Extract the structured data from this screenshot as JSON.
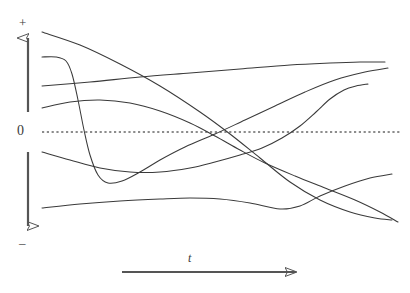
{
  "figure": {
    "kind": "line",
    "title": "",
    "background_color": "#ffffff",
    "stroke_color": "#3a3a3a",
    "axis_color": "#555555",
    "zero_line_color": "#1a1a1a",
    "width": 410,
    "height": 293
  },
  "axes": {
    "vertical": {
      "name": "amplitude-axis",
      "positive_label": "+",
      "zero_label": "0",
      "negative_label": "–",
      "zero_pixel_y": 132,
      "upper_arrow": {
        "x": 28,
        "y_tail": 112,
        "y_head": 33,
        "direction": "up"
      },
      "lower_arrow": {
        "x": 28,
        "y_tail": 152,
        "y_head": 231,
        "direction": "down"
      }
    },
    "horizontal": {
      "name": "time-axis",
      "label": "t",
      "arrow": {
        "x_tail": 122,
        "x_head": 301,
        "y": 272,
        "direction": "right"
      }
    },
    "zero_line": {
      "name": "zero-reference-line",
      "style": "dotted",
      "y": 132,
      "x_start": 42,
      "x_end": 401
    }
  },
  "chart_data": {
    "type": "line",
    "title": "",
    "xlabel": "t",
    "ylabel": "",
    "grid": false,
    "legend": null,
    "xlim": [
      42,
      401
    ],
    "ylim_pixels": [
      24,
      240
    ],
    "zero_y_pixel": 132,
    "note": "Six unlabeled qualitative curves drawn over a dotted zero reference line; values are pixel coordinates of the traced paths.",
    "series": [
      {
        "name": "curve-1-descending-steep",
        "points": [
          [
            42,
            32
          ],
          [
            80,
            45
          ],
          [
            120,
            64
          ],
          [
            160,
            86
          ],
          [
            200,
            112
          ],
          [
            230,
            134
          ],
          [
            260,
            158
          ],
          [
            290,
            182
          ],
          [
            320,
            200
          ],
          [
            350,
            212
          ],
          [
            375,
            218
          ],
          [
            392,
            220
          ]
        ]
      },
      {
        "name": "curve-2-early-plunge-recover",
        "points": [
          [
            42,
            57
          ],
          [
            56,
            57
          ],
          [
            66,
            61
          ],
          [
            72,
            74
          ],
          [
            78,
            100
          ],
          [
            84,
            130
          ],
          [
            90,
            155
          ],
          [
            98,
            175
          ],
          [
            108,
            183
          ],
          [
            122,
            181
          ],
          [
            140,
            172
          ],
          [
            160,
            160
          ],
          [
            185,
            147
          ],
          [
            215,
            134
          ],
          [
            245,
            120
          ],
          [
            275,
            106
          ],
          [
            305,
            92
          ],
          [
            335,
            80
          ],
          [
            365,
            72
          ],
          [
            388,
            68
          ]
        ]
      },
      {
        "name": "curve-3-slow-rise-flat",
        "points": [
          [
            42,
            86
          ],
          [
            90,
            82
          ],
          [
            140,
            77
          ],
          [
            190,
            73
          ],
          [
            240,
            69
          ],
          [
            290,
            65
          ],
          [
            330,
            63
          ],
          [
            360,
            62
          ],
          [
            385,
            62
          ]
        ]
      },
      {
        "name": "curve-4-hump-then-fall",
        "points": [
          [
            42,
            108
          ],
          [
            70,
            102
          ],
          [
            100,
            100
          ],
          [
            130,
            103
          ],
          [
            160,
            111
          ],
          [
            190,
            123
          ],
          [
            215,
            136
          ],
          [
            240,
            150
          ],
          [
            265,
            163
          ],
          [
            295,
            176
          ],
          [
            325,
            188
          ],
          [
            355,
            200
          ],
          [
            380,
            212
          ],
          [
            398,
            222
          ]
        ]
      },
      {
        "name": "curve-5-dip-then-strong-rise",
        "points": [
          [
            42,
            152
          ],
          [
            70,
            160
          ],
          [
            100,
            168
          ],
          [
            130,
            172
          ],
          [
            160,
            172
          ],
          [
            190,
            168
          ],
          [
            215,
            162
          ],
          [
            240,
            155
          ],
          [
            262,
            148
          ],
          [
            282,
            138
          ],
          [
            300,
            126
          ],
          [
            316,
            112
          ],
          [
            330,
            99
          ],
          [
            344,
            90
          ],
          [
            356,
            86
          ],
          [
            368,
            84
          ]
        ]
      },
      {
        "name": "curve-6-low-flat-gentle-arc",
        "points": [
          [
            42,
            208
          ],
          [
            80,
            204
          ],
          [
            120,
            201
          ],
          [
            160,
            199
          ],
          [
            190,
            198
          ],
          [
            220,
            199
          ],
          [
            250,
            203
          ],
          [
            280,
            209
          ],
          [
            300,
            206
          ],
          [
            320,
            196
          ],
          [
            345,
            186
          ],
          [
            370,
            178
          ],
          [
            392,
            174
          ]
        ]
      }
    ]
  }
}
